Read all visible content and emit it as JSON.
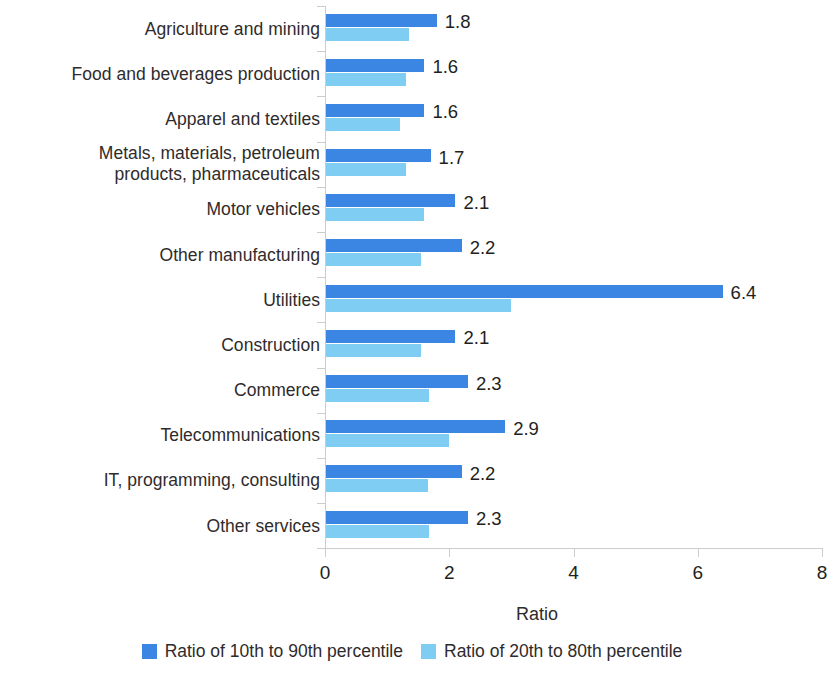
{
  "chart_data": {
    "type": "bar",
    "orientation": "horizontal",
    "title": "",
    "xlabel": "Ratio",
    "ylabel": "",
    "xlim": [
      0,
      8
    ],
    "xticks": [
      "0",
      "2",
      "4",
      "6",
      "8"
    ],
    "grid": false,
    "legend_position": "bottom",
    "categories": [
      "Agriculture and mining",
      "Food and beverages production",
      "Apparel and textiles",
      "Metals, materials, petroleum\nproducts, pharmaceuticals",
      "Motor vehicles",
      "Other manufacturing",
      "Utilities",
      "Construction",
      "Commerce",
      "Telecommunications",
      "IT, programming, consulting",
      "Other services"
    ],
    "series": [
      {
        "name": "Ratio of 10th to 90th percentile",
        "color": "#3a86e2",
        "values": [
          1.8,
          1.6,
          1.6,
          1.7,
          2.1,
          2.2,
          6.4,
          2.1,
          2.3,
          2.9,
          2.2,
          2.3
        ],
        "labels": [
          "1.8",
          "1.6",
          "1.6",
          "1.7",
          "2.1",
          "2.2",
          "6.4",
          "2.1",
          "2.3",
          "2.9",
          "2.2",
          "2.3"
        ]
      },
      {
        "name": "Ratio of 20th to 80th percentile",
        "color": "#7fcdf2",
        "values": [
          1.35,
          1.3,
          1.2,
          1.3,
          1.6,
          1.55,
          3.0,
          1.55,
          1.68,
          2.0,
          1.65,
          1.67
        ],
        "labels": [
          "",
          "",
          "",
          "",
          "",
          "",
          "",
          "",
          "",
          "",
          "",
          ""
        ]
      }
    ]
  },
  "axis": {
    "x_title": "Ratio",
    "tick_labels": [
      "0",
      "2",
      "4",
      "6",
      "8"
    ]
  },
  "legend": {
    "items": [
      {
        "label": "Ratio of 10th to 90th percentile",
        "color": "#3a86e2"
      },
      {
        "label": "Ratio of 20th to 80th percentile",
        "color": "#7fcdf2"
      }
    ]
  }
}
